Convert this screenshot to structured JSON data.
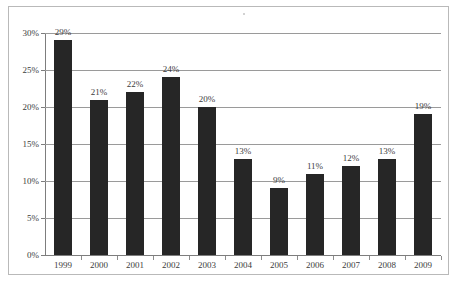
{
  "chart_data": {
    "type": "bar",
    "title": "",
    "subtitle": "",
    "xlabel": "",
    "ylabel": "",
    "categories": [
      "1999",
      "2000",
      "2001",
      "2002",
      "2003",
      "2004",
      "2005",
      "2006",
      "2007",
      "2008",
      "2009"
    ],
    "values": [
      29,
      21,
      22,
      24,
      20,
      13,
      9,
      11,
      12,
      13,
      19
    ],
    "value_labels": [
      "29%",
      "21%",
      "22%",
      "24%",
      "20%",
      "13%",
      "9%",
      "11%",
      "12%",
      "13%",
      "19%"
    ],
    "ylim": [
      0,
      30
    ],
    "ytick_values": [
      0,
      5,
      10,
      15,
      20,
      25,
      30
    ],
    "ytick_labels": [
      "0%",
      "5%",
      "10%",
      "15%",
      "20%",
      "25%",
      "30%"
    ],
    "grid": "horizontal",
    "legend": "none",
    "series": [
      {
        "name": "",
        "values": [
          29,
          21,
          22,
          24,
          20,
          13,
          9,
          11,
          12,
          13,
          19
        ]
      }
    ],
    "colors": {
      "bar": "#262626",
      "gridline": "#9a9a9a",
      "axis": "#7d7d7d",
      "text": "#3c3c3c",
      "frame_border": "#b9b9b9",
      "background": "#ffffff"
    }
  }
}
